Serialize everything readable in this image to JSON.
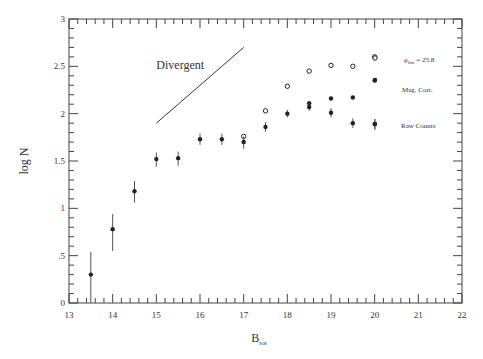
{
  "chart_data": {
    "type": "scatter",
    "title": "",
    "xlabel": "B",
    "xlabel_sub": "tot",
    "ylabel": "log N",
    "xlim": [
      13,
      22
    ],
    "ylim": [
      0,
      3
    ],
    "x_ticks": [
      13,
      14,
      15,
      16,
      17,
      18,
      19,
      20,
      21,
      22
    ],
    "x_tick_labels": [
      "13",
      "14",
      "15",
      "16",
      "17",
      "18",
      "19",
      "20",
      "21",
      "22"
    ],
    "y_ticks": [
      0,
      0.5,
      1,
      1.5,
      2,
      2.5,
      3
    ],
    "y_tick_labels": [
      "0",
      ".5",
      "1",
      "1.5",
      "2",
      "2.5",
      "3"
    ],
    "x_minor_step": 0.2,
    "y_minor_step": 0.1,
    "grid": false,
    "legend_position": "upper right (inside)",
    "series": [
      {
        "name": "μlim = 25.8",
        "name_main": "μ",
        "name_sub": "lim",
        "name_rest": " = 25.8",
        "marker": "open-circle",
        "x": [
          17.0,
          17.5,
          18.0,
          18.5,
          19.0,
          19.5,
          20.0
        ],
        "y": [
          1.76,
          2.03,
          2.29,
          2.45,
          2.51,
          2.5,
          2.6
        ]
      },
      {
        "name": "Mag. Corr.",
        "marker": "filled-circle",
        "x": [
          18.5,
          19.0,
          19.5,
          20.0
        ],
        "y": [
          2.11,
          2.16,
          2.17,
          2.35
        ]
      },
      {
        "name": "Raw Counts",
        "marker": "filled-circle-errorbar",
        "x": [
          13.5,
          14.0,
          14.5,
          15.0,
          15.5,
          16.0,
          16.5,
          17.0,
          17.5,
          18.0,
          18.5,
          19.0,
          19.5,
          20.0
        ],
        "y": [
          0.3,
          0.78,
          1.18,
          1.52,
          1.53,
          1.73,
          1.73,
          1.7,
          1.86,
          2.0,
          2.07,
          2.01,
          1.9,
          1.89
        ],
        "err_low": [
          0.3,
          0.23,
          0.12,
          0.08,
          0.08,
          0.06,
          0.06,
          0.07,
          0.05,
          0.04,
          0.04,
          0.05,
          0.05,
          0.05
        ],
        "err_high": [
          0.24,
          0.16,
          0.11,
          0.07,
          0.07,
          0.06,
          0.06,
          0.06,
          0.05,
          0.04,
          0.04,
          0.05,
          0.05,
          0.05
        ]
      }
    ],
    "annotations": [
      {
        "text": "Divergent",
        "x": 15.0,
        "y": 2.47
      },
      {
        "type": "line",
        "label": "Divergent",
        "x0": 15.0,
        "y0": 1.9,
        "x1": 17.0,
        "y1": 2.7
      }
    ]
  },
  "legend": {
    "item1_main": "μ",
    "item1_sub": "lim",
    "item1_rest": " = 25.8",
    "item2": "Mag. Corr.",
    "item3": "Raw Counts"
  },
  "labels": {
    "divergent": "Divergent",
    "xlabel": "B",
    "xlabel_sub": "tot",
    "ylabel": "log N"
  },
  "colors": {
    "axis": "#444444",
    "marker": "#222222",
    "background": "#ffffff"
  }
}
